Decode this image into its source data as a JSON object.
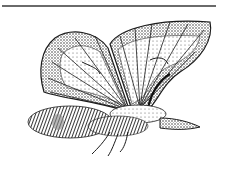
{
  "image": {
    "subject": "stippled engraving of a moth with wings raised",
    "colors": {
      "ink": "#1a1a1a",
      "mid_gray": "#8a8a8a",
      "rule": "#6a6a6a",
      "background": "#ffffff"
    }
  }
}
